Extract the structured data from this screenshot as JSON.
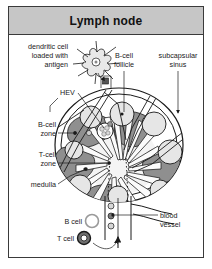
{
  "figure": {
    "title": "Lymph node",
    "type": "anatomical-diagram",
    "background_color": "#ffffff",
    "title_bar_color": "#c6c6c6",
    "border_color": "#3a3a3a"
  },
  "labels": {
    "dendritic_cell": "dendritic cell\nloaded with\nantigen",
    "dendritic_cell_line1": "dendritic cell",
    "dendritic_cell_line2": "loaded with",
    "dendritic_cell_line3": "antigen",
    "bcell_follicle_line1": "B-cell",
    "bcell_follicle_line2": "follicle",
    "subcapsular_sinus_line1": "subcapsular",
    "subcapsular_sinus_line2": "sinus",
    "hev": "HEV",
    "bcell_zone_line1": "B-cell",
    "bcell_zone_line2": "zone",
    "tcell_zone_line1": "T-cell",
    "tcell_zone_line2": "zone",
    "medulla": "medulla",
    "blood_vessel_line1": "blood",
    "blood_vessel_line2": "vessel",
    "bcell_key": "B cell",
    "tcell_key": "T cell"
  },
  "legend": {
    "items": [
      {
        "name": "B cell",
        "style": "light-ring",
        "fill": "#efefef",
        "stroke": "#555555"
      },
      {
        "name": "T cell",
        "style": "dark-filled",
        "fill": "#6f6f6f",
        "stroke": "#1a1a1a"
      }
    ]
  },
  "structures": {
    "capsule": "outer lymph node capsule",
    "subcapsular_sinus": "space beneath capsule",
    "tcell_zone_fill": "#8f8f8f",
    "bcell_follicle_fill": "#e3e3e3",
    "medulla_fill": "#f2f2f2",
    "afferent_vessel": "afferent lymphatic vessel",
    "efferent_vessel": "efferent lymphatic / blood vessel",
    "follicle_count": 6,
    "tcell_zone_count": 5
  }
}
